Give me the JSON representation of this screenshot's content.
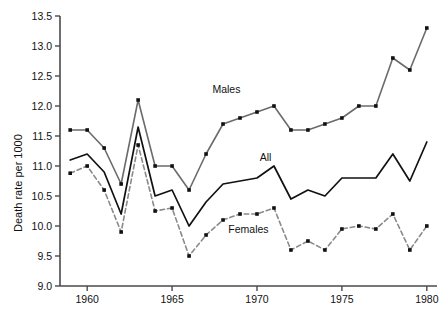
{
  "chart_data": {
    "type": "line",
    "title": "",
    "xlabel": "",
    "ylabel": "Death rate per 1000",
    "xlim": [
      1958.4,
      1980.6
    ],
    "ylim": [
      9.0,
      13.5
    ],
    "grid": false,
    "legend_position": "inline-annotations",
    "x_ticks": [
      1960,
      1965,
      1970,
      1975,
      1980
    ],
    "x_tick_labels": [
      "1960",
      "1965",
      "1970",
      "1975",
      "1980"
    ],
    "y_ticks": [
      9.0,
      9.5,
      10.0,
      10.5,
      11.0,
      11.5,
      12.0,
      12.5,
      13.0,
      13.5
    ],
    "y_tick_labels": [
      "9.0",
      "9.5",
      "10.0",
      "10.5",
      "11.0",
      "11.5",
      "12.0",
      "12.5",
      "13.0",
      "13.5"
    ],
    "x": [
      1959,
      1960,
      1961,
      1962,
      1963,
      1964,
      1965,
      1966,
      1967,
      1968,
      1969,
      1970,
      1971,
      1972,
      1973,
      1974,
      1975,
      1976,
      1977,
      1978,
      1979,
      1980
    ],
    "series": [
      {
        "name": "Males",
        "color": "#6b6b6b",
        "style": "solid",
        "marker": "square",
        "values": [
          11.6,
          11.6,
          11.3,
          10.7,
          12.1,
          11.0,
          11.0,
          10.6,
          11.2,
          11.7,
          11.8,
          11.9,
          12.0,
          11.6,
          11.6,
          11.7,
          11.8,
          12.0,
          12.0,
          12.8,
          12.6,
          13.3
        ]
      },
      {
        "name": "All",
        "color": "#111111",
        "style": "solid",
        "marker": "none",
        "values": [
          11.1,
          11.2,
          10.9,
          10.2,
          11.65,
          10.5,
          10.6,
          10.0,
          10.4,
          10.7,
          10.75,
          10.8,
          11.0,
          10.45,
          10.6,
          10.5,
          10.8,
          10.8,
          10.8,
          11.2,
          10.75,
          11.4
        ]
      },
      {
        "name": "Females",
        "color": "#8a8a8a",
        "style": "dashed",
        "marker": "square",
        "values": [
          10.88,
          11.0,
          10.6,
          9.9,
          11.35,
          10.25,
          10.3,
          9.5,
          9.85,
          10.1,
          10.2,
          10.2,
          10.3,
          9.6,
          9.75,
          9.6,
          9.95,
          10.0,
          9.95,
          10.2,
          9.6,
          10.0
        ]
      }
    ],
    "annotations": [
      {
        "text": "Males",
        "x": 1968.2,
        "y": 12.22,
        "series": "Males"
      },
      {
        "text": "All",
        "x": 1970.5,
        "y": 11.09,
        "series": "All"
      },
      {
        "text": "Females",
        "x": 1969.5,
        "y": 9.88,
        "series": "Females"
      }
    ]
  }
}
